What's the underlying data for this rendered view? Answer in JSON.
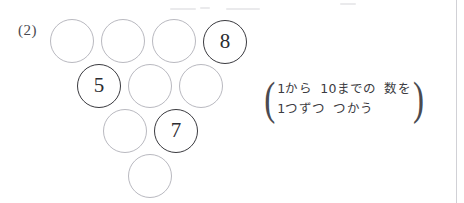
{
  "problem": {
    "number_label": "(2)"
  },
  "puzzle": {
    "shape": "triangle",
    "total_circles": 10,
    "rows": [
      {
        "row_index": 0,
        "circles": [
          {
            "value": "",
            "filled": false,
            "x": 50,
            "y": 19
          },
          {
            "value": "",
            "filled": false,
            "x": 101,
            "y": 19
          },
          {
            "value": "",
            "filled": false,
            "x": 152,
            "y": 19
          },
          {
            "value": "8",
            "filled": true,
            "x": 203,
            "y": 20
          }
        ]
      },
      {
        "row_index": 1,
        "circles": [
          {
            "value": "5",
            "filled": true,
            "x": 77,
            "y": 64
          },
          {
            "value": "",
            "filled": false,
            "x": 128,
            "y": 64
          },
          {
            "value": "",
            "filled": false,
            "x": 179,
            "y": 64
          }
        ]
      },
      {
        "row_index": 2,
        "circles": [
          {
            "value": "",
            "filled": false,
            "x": 103,
            "y": 109
          },
          {
            "value": "7",
            "filled": true,
            "x": 154,
            "y": 109
          }
        ]
      },
      {
        "row_index": 3,
        "circles": [
          {
            "value": "",
            "filled": false,
            "x": 128,
            "y": 154
          }
        ]
      }
    ]
  },
  "hint": {
    "open_paren": "(",
    "close_paren": ")",
    "line1": "1から  10までの  数を",
    "line2": "1つずつ  つかう"
  },
  "colors": {
    "page_background": "#ffffff",
    "empty_circle_stroke": "#b9b9c0",
    "filled_circle_stroke": "#3a3a3f",
    "text": "#3b3b41",
    "label_text": "#4a4a50",
    "edge_rule": "#c9c9cf"
  },
  "artifacts": [
    {
      "x": 170,
      "y": 8,
      "w": 26,
      "h": 2
    },
    {
      "x": 200,
      "y": 7,
      "w": 10,
      "h": 2
    },
    {
      "x": 226,
      "y": 8,
      "w": 34,
      "h": 2
    },
    {
      "x": 340,
      "y": 3,
      "w": 16,
      "h": 2
    }
  ],
  "edge_rule": {
    "x": 456
  }
}
